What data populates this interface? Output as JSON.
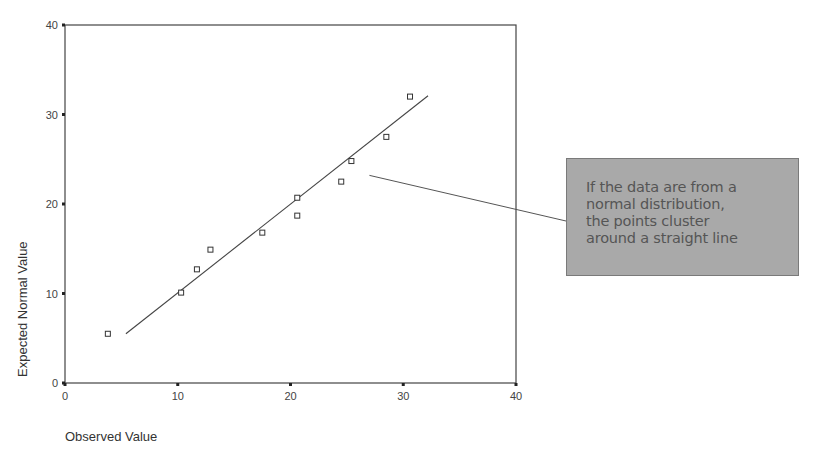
{
  "chart_data": {
    "type": "scatter",
    "title": "",
    "xlabel": "Observed Value",
    "ylabel": "Expected Normal Value",
    "xlim": [
      0,
      40
    ],
    "ylim": [
      0,
      40
    ],
    "xticks": [
      0,
      10,
      20,
      30,
      40
    ],
    "yticks": [
      0,
      10,
      20,
      30,
      40
    ],
    "grid": false,
    "legend": null,
    "series": [
      {
        "name": "data points",
        "marker": "open-square",
        "points": [
          {
            "x": 3.8,
            "y": 5.5
          },
          {
            "x": 10.3,
            "y": 10.1
          },
          {
            "x": 11.7,
            "y": 12.7
          },
          {
            "x": 12.9,
            "y": 14.9
          },
          {
            "x": 17.5,
            "y": 16.8
          },
          {
            "x": 20.6,
            "y": 18.7
          },
          {
            "x": 20.6,
            "y": 20.7
          },
          {
            "x": 24.5,
            "y": 22.5
          },
          {
            "x": 25.4,
            "y": 24.8
          },
          {
            "x": 28.5,
            "y": 27.5
          },
          {
            "x": 30.6,
            "y": 32.0
          }
        ]
      },
      {
        "name": "normal reference line",
        "type": "line",
        "points": [
          {
            "x": 5.4,
            "y": 5.5
          },
          {
            "x": 32.2,
            "y": 32.1
          }
        ]
      }
    ],
    "annotations": [
      {
        "text": "If the data are from a normal distribution, the points cluster around a straight line",
        "pointer_from": {
          "x": 27.0,
          "y": 23.2
        }
      }
    ]
  },
  "callout": {
    "text": "If the data are from a\nnormal distribution,\nthe points cluster\naround a straight line",
    "fill": "#a9a9a9",
    "text_color": "#555555"
  }
}
